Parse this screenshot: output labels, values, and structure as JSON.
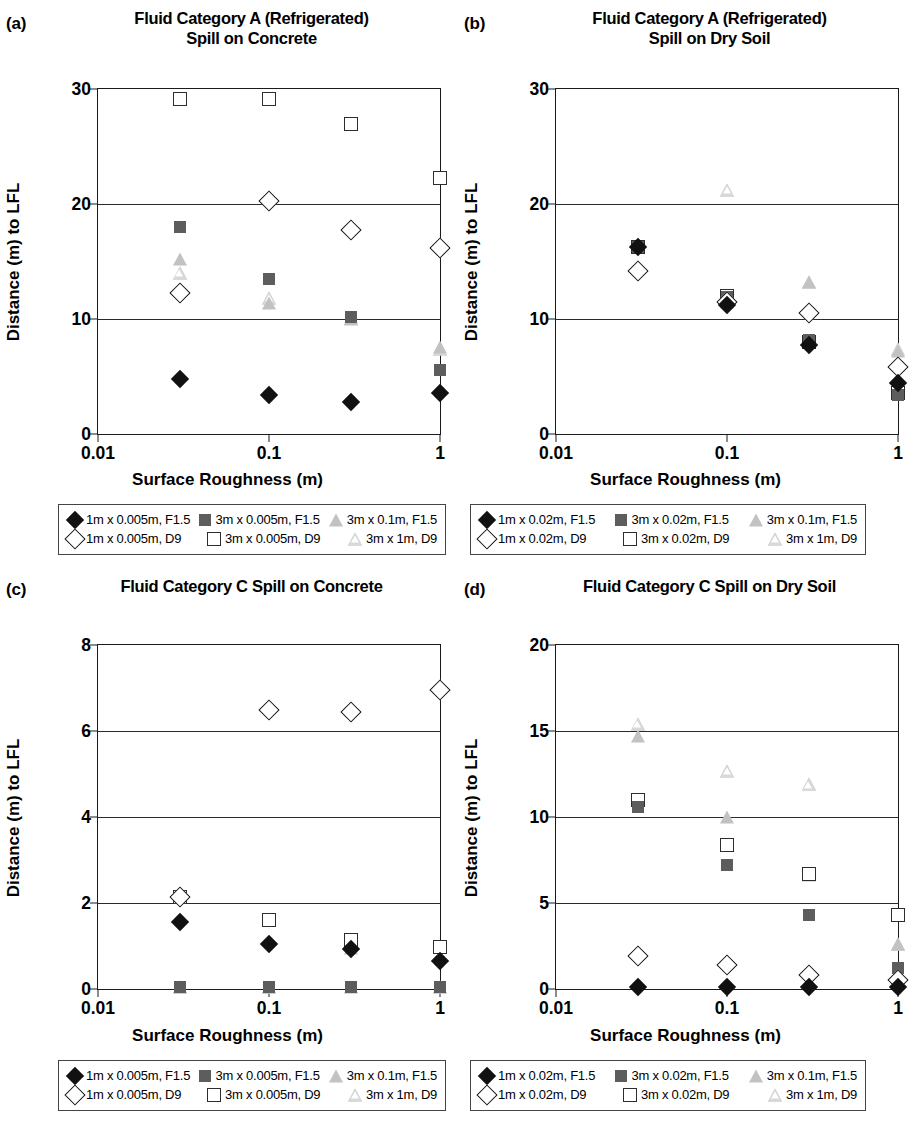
{
  "figure": {
    "xlabel": "Surface Roughness (m)",
    "ylabel": "Distance (m) to LFL",
    "xticks": [
      "0.01",
      "0.1",
      "1"
    ],
    "colors": {
      "filled_diamond": "#111111",
      "filled_square": "#5d5d5d",
      "filled_triangle": "#c2c2c2",
      "open_outline": "#111111",
      "axis": "#1a1a1a"
    }
  },
  "panels": [
    {
      "tag": "(a)",
      "title_line1": "Fluid Category A (Refrigerated)",
      "title_line2": "Spill on Concrete",
      "yticks": [
        "0",
        "10",
        "20",
        "30"
      ]
    },
    {
      "tag": "(b)",
      "title_line1": "Fluid Category A (Refrigerated)",
      "title_line2": "Spill on Dry Soil",
      "yticks": [
        "0",
        "10",
        "20",
        "30"
      ]
    },
    {
      "tag": "(c)",
      "title_line1": "Fluid Category C Spill on Concrete",
      "title_line2": "",
      "yticks": [
        "0",
        "2",
        "4",
        "6",
        "8"
      ]
    },
    {
      "tag": "(d)",
      "title_line1": "Fluid Category C Spill on Dry Soil",
      "title_line2": "",
      "yticks": [
        "0",
        "5",
        "10",
        "15",
        "20"
      ]
    }
  ],
  "legends": {
    "a": [
      "1m x 0.005m, F1.5",
      "3m x 0.005m, F1.5",
      "3m x 0.1m, F1.5",
      "1m x 0.005m, D9",
      "3m x 0.005m, D9",
      "3m x 1m, D9"
    ],
    "b": [
      "1m x 0.02m, F1.5",
      "3m x 0.02m, F1.5",
      "3m x 0.1m, F1.5",
      "1m x 0.02m, D9",
      "3m x 0.02m, D9",
      "3m x 1m, D9"
    ],
    "c": [
      "1m x 0.005m, F1.5",
      "3m x 0.005m, F1.5",
      "3m x 0.1m, F1.5",
      "1m x 0.005m, D9",
      "3m x 0.005m, D9",
      "3m x 1m, D9"
    ],
    "d": [
      "1m x 0.02m, F1.5",
      "3m x 0.02m, F1.5",
      "3m x 0.1m, F1.5",
      "1m x 0.02m, D9",
      "3m x 0.02m, D9",
      "3m x 1m, D9"
    ]
  },
  "chart_data": [
    {
      "panel": "a",
      "type": "scatter",
      "title": "Fluid Category A (Refrigerated) Spill on Concrete",
      "xlabel": "Surface Roughness (m)",
      "ylabel": "Distance (m) to LFL",
      "xscale": "log",
      "xlim": [
        0.01,
        1
      ],
      "ylim": [
        0,
        30
      ],
      "yticks": [
        0,
        10,
        20,
        30
      ],
      "grid": true,
      "legend_position": "below",
      "x": [
        0.03,
        0.1,
        0.3,
        1
      ],
      "series": [
        {
          "name": "1m x 0.005m, F1.5",
          "marker": "diamond-f",
          "values": [
            4.8,
            3.4,
            2.8,
            3.6
          ]
        },
        {
          "name": "3m x 0.005m, F1.5",
          "marker": "square-f",
          "values": [
            18.0,
            13.5,
            10.2,
            5.6
          ]
        },
        {
          "name": "3m x 0.1m, F1.5",
          "marker": "tri-f",
          "values": [
            15.2,
            11.4,
            10.0,
            7.6
          ]
        },
        {
          "name": "1m x 0.005m, D9",
          "marker": "diamond-o",
          "values": [
            12.3,
            20.3,
            17.7,
            16.2
          ]
        },
        {
          "name": "3m x 0.005m, D9",
          "marker": "square-o",
          "values": [
            29.1,
            29.1,
            27.0,
            22.3
          ]
        },
        {
          "name": "3m x 1m, D9",
          "marker": "tri-o",
          "values": [
            14.0,
            11.8,
            10.1,
            7.4
          ]
        }
      ]
    },
    {
      "panel": "b",
      "type": "scatter",
      "title": "Fluid Category A (Refrigerated) Spill on Dry Soil",
      "xlabel": "Surface Roughness (m)",
      "ylabel": "Distance (m) to LFL",
      "xscale": "log",
      "xlim": [
        0.01,
        1
      ],
      "ylim": [
        0,
        30
      ],
      "yticks": [
        0,
        10,
        20,
        30
      ],
      "grid": true,
      "legend_position": "below",
      "x": [
        0.03,
        0.1,
        0.3,
        1
      ],
      "series": [
        {
          "name": "1m x 0.02m, F1.5",
          "marker": "diamond-f",
          "values": [
            16.3,
            11.2,
            7.7,
            4.4
          ]
        },
        {
          "name": "3m x 0.02m, F1.5",
          "marker": "square-f",
          "values": [
            16.3,
            11.9,
            8.2,
            3.4
          ]
        },
        {
          "name": "3m x 0.1m, F1.5",
          "marker": "tri-f",
          "values": [
            16.3,
            11.5,
            13.2,
            7.2
          ]
        },
        {
          "name": "1m x 0.02m, D9",
          "marker": "diamond-o",
          "values": [
            14.2,
            11.5,
            10.5,
            5.8
          ]
        },
        {
          "name": "3m x 0.02m, D9",
          "marker": "square-o",
          "values": [
            16.3,
            12.0,
            8.0,
            3.6
          ]
        },
        {
          "name": "3m x 1m, D9",
          "marker": "tri-o",
          "values": [
            14.5,
            21.2,
            13.2,
            7.4
          ]
        }
      ]
    },
    {
      "panel": "c",
      "type": "scatter",
      "title": "Fluid Category C Spill on Concrete",
      "xlabel": "Surface Roughness (m)",
      "ylabel": "Distance (m) to LFL",
      "xscale": "log",
      "xlim": [
        0.01,
        1
      ],
      "ylim": [
        0,
        8
      ],
      "yticks": [
        0,
        2,
        4,
        6,
        8
      ],
      "grid": true,
      "legend_position": "below",
      "x": [
        0.03,
        0.1,
        0.3,
        1
      ],
      "series": [
        {
          "name": "1m x 0.005m, F1.5",
          "marker": "diamond-f",
          "values": [
            1.55,
            1.05,
            0.92,
            0.65
          ]
        },
        {
          "name": "3m x 0.005m, F1.5",
          "marker": "square-f",
          "values": [
            0.05,
            0.05,
            0.05,
            0.05
          ]
        },
        {
          "name": "3m x 0.1m, F1.5",
          "marker": "tri-f",
          "values": [
            0.05,
            0.05,
            0.95,
            0.05
          ]
        },
        {
          "name": "1m x 0.005m, D9",
          "marker": "diamond-o",
          "values": [
            2.15,
            6.5,
            6.45,
            6.95
          ]
        },
        {
          "name": "3m x 0.005m, D9",
          "marker": "square-o",
          "values": [
            2.15,
            1.6,
            1.15,
            0.98
          ]
        },
        {
          "name": "3m x 1m, D9",
          "marker": "tri-o",
          "values": [
            0.05,
            0.05,
            0.05,
            0.05
          ]
        }
      ]
    },
    {
      "panel": "d",
      "type": "scatter",
      "title": "Fluid Category C Spill on Dry Soil",
      "xlabel": "Surface Roughness (m)",
      "ylabel": "Distance (m) to LFL",
      "xscale": "log",
      "xlim": [
        0.01,
        1
      ],
      "ylim": [
        0,
        20
      ],
      "yticks": [
        0,
        5,
        10,
        15,
        20
      ],
      "grid": true,
      "legend_position": "below",
      "x": [
        0.03,
        0.1,
        0.3,
        1
      ],
      "series": [
        {
          "name": "1m x 0.02m, F1.5",
          "marker": "diamond-f",
          "values": [
            0.1,
            0.1,
            0.1,
            0.1
          ]
        },
        {
          "name": "3m x 0.02m, F1.5",
          "marker": "square-f",
          "values": [
            10.6,
            7.2,
            4.3,
            1.2
          ]
        },
        {
          "name": "3m x 0.1m, F1.5",
          "marker": "tri-f",
          "values": [
            14.7,
            10.0,
            6.6,
            2.6
          ]
        },
        {
          "name": "1m x 0.02m, D9",
          "marker": "diamond-o",
          "values": [
            1.9,
            1.4,
            0.8,
            0.5
          ]
        },
        {
          "name": "3m x 0.02m, D9",
          "marker": "square-o",
          "values": [
            11.0,
            8.4,
            6.7,
            4.3
          ]
        },
        {
          "name": "3m x 1m, D9",
          "marker": "tri-o",
          "values": [
            15.4,
            12.7,
            11.9,
            2.6
          ]
        }
      ]
    }
  ]
}
